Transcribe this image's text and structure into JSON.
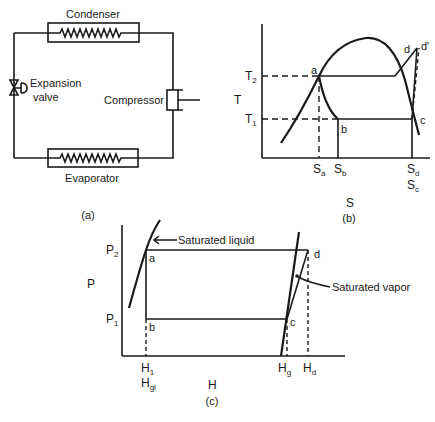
{
  "figure_a": {
    "caption": "(a)",
    "components": {
      "condenser": "Condenser",
      "evaporator": "Evaporator",
      "compressor": "Compressor",
      "expansion_valve_line1": "Expansion",
      "expansion_valve_line2": "valve"
    }
  },
  "figure_b": {
    "caption": "(b)",
    "x_axis_label": "S",
    "y_axis_label": "T",
    "y_ticks": [
      {
        "base": "T",
        "sub": "2"
      },
      {
        "base": "T",
        "sub": "1"
      }
    ],
    "x_ticks": [
      {
        "base": "S",
        "sub": "a"
      },
      {
        "base": "S",
        "sub": "b"
      },
      {
        "base": "S",
        "sub": "d"
      },
      {
        "base": "S",
        "sub": "c"
      }
    ],
    "points": {
      "a": "a",
      "b": "b",
      "c": "c",
      "d": "d",
      "d_prime": "d'"
    }
  },
  "figure_c": {
    "caption": "(c)",
    "x_axis_label": "H",
    "y_axis_label": "P",
    "y_ticks": [
      {
        "base": "P",
        "sub": "2"
      },
      {
        "base": "P",
        "sub": "1"
      }
    ],
    "x_ticks": [
      {
        "base": "H",
        "sub": "1"
      },
      {
        "base": "H",
        "sub": "gl"
      },
      {
        "base": "H",
        "sub": "g"
      },
      {
        "base": "H",
        "sub": "d"
      }
    ],
    "points": {
      "a": "a",
      "b": "b",
      "c": "c",
      "d": "d"
    },
    "annotations": {
      "saturated_liquid": "Saturated liquid",
      "saturated_vapor": "Saturated vapor"
    }
  }
}
